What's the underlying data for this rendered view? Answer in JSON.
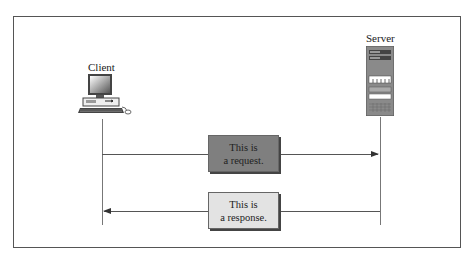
{
  "diagram": {
    "client": {
      "label": "Client",
      "icon": "desktop-computer-icon"
    },
    "server": {
      "label": "Server",
      "icon": "server-tower-icon"
    },
    "messages": [
      {
        "line1": "This is",
        "line2": "a request.",
        "direction": "client-to-server",
        "fill": "#7f7f7f"
      },
      {
        "line1": "This is",
        "line2": "a response.",
        "direction": "server-to-client",
        "fill": "#e3e3e3"
      }
    ]
  }
}
